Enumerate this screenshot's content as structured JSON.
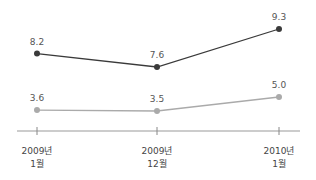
{
  "chart_data": {
    "type": "line",
    "title": "",
    "xlabel": "",
    "ylabel": "",
    "categories": [
      "2009년 1월",
      "2009년 12월",
      "2010년 1월"
    ],
    "category_lines": [
      [
        "2009년",
        "1월"
      ],
      [
        "2009년",
        "12월"
      ],
      [
        "2010년",
        "1월"
      ]
    ],
    "series": [
      {
        "name": "series-1",
        "color": "#3a3a3a",
        "values": [
          8.2,
          7.6,
          9.3
        ],
        "labels": [
          "8.2",
          "7.6",
          "9.3"
        ]
      },
      {
        "name": "series-2",
        "color": "#aaaaaa",
        "values": [
          3.6,
          3.5,
          5.0
        ],
        "labels": [
          "3.6",
          "3.5",
          "5.0"
        ]
      }
    ],
    "grid": false,
    "legend": "none"
  }
}
